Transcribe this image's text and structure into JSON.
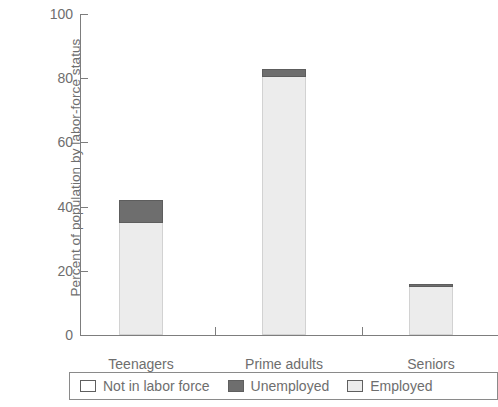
{
  "chart_data": {
    "type": "bar",
    "stacked": true,
    "title": "",
    "xlabel": "",
    "ylabel": "Percent of population by labor-force status",
    "ylim": [
      0,
      100
    ],
    "yticks": [
      0,
      20,
      40,
      60,
      80,
      100
    ],
    "ytick_labels": [
      "0",
      "20",
      "40",
      "60",
      "80",
      "100"
    ],
    "grid": false,
    "legend_position": "bottom",
    "categories": [
      "Teenagers",
      "Prime adults",
      "Seniors"
    ],
    "series": [
      {
        "name": "Employed",
        "color": "#ececec",
        "values": [
          35,
          80.5,
          15
        ]
      },
      {
        "name": "Unemployed",
        "color": "#6e6e6e",
        "values": [
          7,
          2.5,
          1
        ]
      },
      {
        "name": "Not in labor force",
        "color": "#ffffff",
        "values": [
          58,
          17,
          84
        ]
      }
    ],
    "totals_in_labor_force": [
      42,
      83,
      16
    ],
    "legend": [
      {
        "label": "Not in labor force",
        "color": "#ffffff"
      },
      {
        "label": "Unemployed",
        "color": "#6e6e6e"
      },
      {
        "label": "Employed",
        "color": "#ececec"
      }
    ]
  }
}
